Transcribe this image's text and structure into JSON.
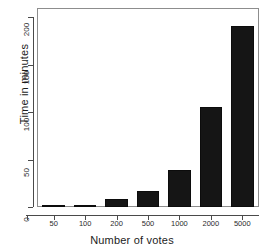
{
  "chart_data": {
    "type": "bar",
    "title": "",
    "subtitle": "",
    "xlabel": "Number of votes",
    "ylabel": "Time in minutes",
    "categories": [
      "50",
      "100",
      "200",
      "500",
      "1000",
      "2000",
      "5000"
    ],
    "values": [
      1.5,
      2,
      8.5,
      16.5,
      39,
      105,
      191
    ],
    "ylim": [
      0,
      200
    ],
    "yticks": [
      0,
      50,
      100,
      150,
      200
    ],
    "ytick_labels": [
      "0",
      "50",
      "100",
      "150",
      "200"
    ],
    "grid": false,
    "legend": null,
    "legend_position": "none",
    "bar_color": "#151515",
    "axis_color": "#4a4a4a",
    "frame_color": "#8d8d8d",
    "background": "#ffffff"
  }
}
